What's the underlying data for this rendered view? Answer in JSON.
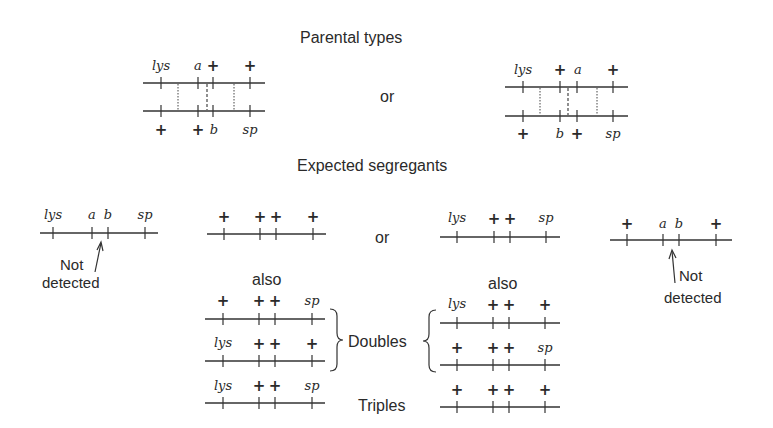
{
  "headings": {
    "parental": "Parental types",
    "expected": "Expected segregants"
  },
  "connectors": {
    "or_top": "or",
    "or_middle": "or"
  },
  "side_labels": {
    "also_left": "also",
    "also_right": "also",
    "doubles": "Doubles",
    "triples": "Triples"
  },
  "annotations": {
    "left_not": "Not",
    "left_detected": "detected",
    "right_not": "Not",
    "right_detected": "detected"
  },
  "parental": {
    "left": {
      "top": [
        "lys",
        "a",
        "+",
        "+"
      ],
      "bottom": [
        "+",
        "+",
        "b",
        "sp"
      ]
    },
    "right": {
      "top": [
        "lys",
        "+",
        "a",
        "+"
      ],
      "bottom": [
        "+",
        "b",
        "+",
        "sp"
      ]
    }
  },
  "segregants": {
    "row1": [
      [
        "lys",
        "a",
        "b",
        "sp"
      ],
      [
        "+",
        "+",
        "+",
        "+"
      ],
      [
        "lys",
        "+",
        "+",
        "sp"
      ],
      [
        "+",
        "a",
        "b",
        "+"
      ]
    ],
    "doubles_left": [
      [
        "+",
        "+",
        "+",
        "sp"
      ],
      [
        "lys",
        "+",
        "+",
        "+"
      ]
    ],
    "doubles_right": [
      [
        "lys",
        "+",
        "+",
        "+"
      ],
      [
        "+",
        "+",
        "+",
        "sp"
      ]
    ],
    "triples_left": [
      "lys",
      "+",
      "+",
      "sp"
    ],
    "triples_right": [
      "+",
      "+",
      "+",
      "+"
    ]
  }
}
